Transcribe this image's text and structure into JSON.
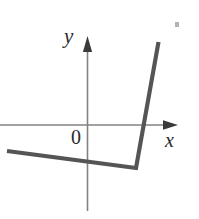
{
  "figure": {
    "kind": "math-graph-piecewise-linear",
    "width": 199,
    "height": 219,
    "background_color": "#ffffff"
  },
  "axes": {
    "x_axis": {
      "label": "x",
      "label_position": {
        "x": 165,
        "y": 130
      },
      "line": {
        "x1": 0,
        "y1": 125,
        "x2": 172,
        "y2": 125
      },
      "arrow_tip": {
        "x": 178,
        "y": 125
      },
      "color": "#828282",
      "width": 1.6,
      "has_arrow": true
    },
    "y_axis": {
      "label": "y",
      "label_position": {
        "x": 64,
        "y": 26
      },
      "line": {
        "x1": 87.5,
        "y1": 44,
        "x2": 87.5,
        "y2": 211
      },
      "arrow_tip": {
        "x": 87.5,
        "y": 36
      },
      "color": "#828282",
      "width": 1.6,
      "has_arrow": true
    },
    "origin_label": "0",
    "origin_label_position": {
      "x": 71,
      "y": 127
    },
    "origin_point": {
      "x": 87.5,
      "y": 125
    }
  },
  "chart_data": {
    "type": "line",
    "title": "",
    "xlabel": "x",
    "ylabel": "y",
    "grid": false,
    "legend": false,
    "series": [
      {
        "name": "piecewise-curve",
        "color": "#555555",
        "width": 4.2,
        "points_px": [
          {
            "x": 7,
            "y": 151
          },
          {
            "x": 136,
            "y": 168
          },
          {
            "x": 158.5,
            "y": 42
          }
        ],
        "segments": [
          {
            "name": "left-shallow-descending-segment",
            "from": {
              "x": 7,
              "y": 151
            },
            "to": {
              "x": 136,
              "y": 168
            }
          },
          {
            "name": "right-steep-ascending-segment",
            "from": {
              "x": 136,
              "y": 168
            },
            "to": {
              "x": 158.5,
              "y": 42
            }
          }
        ]
      }
    ],
    "features": {
      "corner_point_px": {
        "x": 136,
        "y": 168
      },
      "x_intercept_px": {
        "x": 142.5,
        "y": 125
      }
    }
  },
  "artifacts": [
    {
      "name": "scan-speck",
      "x": 175,
      "y": 22,
      "width": 4,
      "height": 5,
      "color": "#9a9a9a"
    }
  ],
  "colors": {
    "curve": "#555555",
    "axis": "#828282",
    "text": "#2a2a2a",
    "background": "#ffffff"
  }
}
